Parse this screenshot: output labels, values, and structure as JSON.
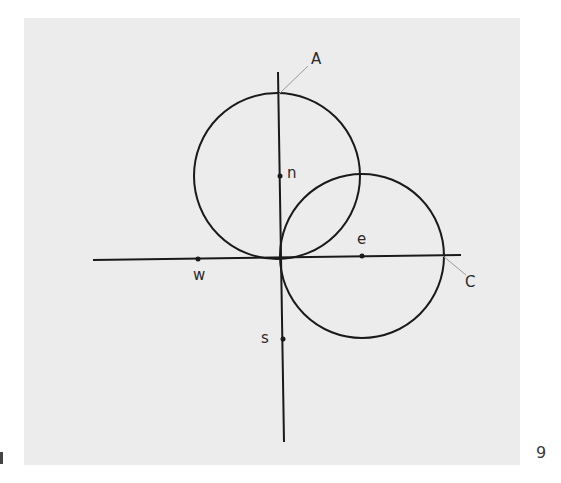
{
  "figure": {
    "background": "#ececec",
    "stroke_color": "#1a1a1a",
    "leader_color": "#9a9a9a",
    "axes": {
      "vertical": {
        "x1": 278,
        "y1": 72,
        "x2": 284,
        "y2": 442
      },
      "horizontal": {
        "x1": 93,
        "y1": 260,
        "x2": 461,
        "y2": 255
      }
    },
    "circles": [
      {
        "name": "upper-circle",
        "cx": 277,
        "cy": 176,
        "r": 83
      },
      {
        "name": "right-circle",
        "cx": 362,
        "cy": 256,
        "r": 82
      }
    ],
    "points": [
      {
        "name": "n",
        "x": 280,
        "y": 176
      },
      {
        "name": "e",
        "x": 362,
        "y": 256
      },
      {
        "name": "w",
        "x": 198,
        "y": 259
      },
      {
        "name": "s",
        "x": 283,
        "y": 339
      }
    ],
    "leaders": [
      {
        "name": "A",
        "x1": 279,
        "y1": 94,
        "x2": 308,
        "y2": 66
      },
      {
        "name": "C",
        "x1": 443,
        "y1": 256,
        "x2": 466,
        "y2": 275
      }
    ],
    "labels": {
      "A": "A",
      "n": "n",
      "e": "e",
      "w": "w",
      "C": "C",
      "s": "s"
    }
  },
  "page": {
    "number": "9"
  }
}
